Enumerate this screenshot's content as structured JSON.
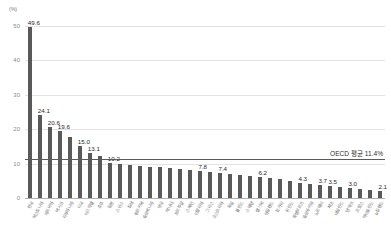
{
  "chart_data": {
    "type": "bar",
    "title": "",
    "xlabel": "",
    "ylabel": "(%)",
    "yunit": "(%)",
    "ylim": [
      0,
      50
    ],
    "yticks": [
      50,
      40,
      30,
      20,
      10,
      0
    ],
    "grid": true,
    "legend": "none",
    "annotations": [
      {
        "text": "OECD 평균 11.4%",
        "value": 11.4,
        "type": "average-line"
      }
    ],
    "categories": [
      "한국",
      "에스토니아",
      "라트비아",
      "멕시코",
      "리투아니아",
      "미국",
      "이스라엘",
      "호주",
      "일본",
      "스위스",
      "칠레",
      "튀르키예",
      "슬로베니아",
      "영국",
      "캐나다",
      "포르투갈",
      "스페인",
      "이탈리아",
      "그리스",
      "오스트리아",
      "독일",
      "폴란드",
      "스웨덴",
      "벨기에",
      "아일랜드",
      "헝가리",
      "핀란드",
      "룩셈부르크",
      "슬로바키아",
      "노르웨이",
      "체코",
      "네덜란드",
      "덴마크",
      "프랑스",
      "아이슬란드",
      "뉴질랜드"
    ],
    "values": [
      49.6,
      24.1,
      20.6,
      19.6,
      17.8,
      15.0,
      13.1,
      12.2,
      10.2,
      9.8,
      9.6,
      9.4,
      9.1,
      8.9,
      8.7,
      8.4,
      8.2,
      7.8,
      7.6,
      7.4,
      7.1,
      6.8,
      6.5,
      6.2,
      5.8,
      5.4,
      5.0,
      4.3,
      4.0,
      3.7,
      3.5,
      3.3,
      3.0,
      2.6,
      2.3,
      2.1
    ],
    "value_labels": {
      "0": "49.6",
      "1": "24.1",
      "2": "20.6",
      "3": "19.6",
      "5": "15.0",
      "6": "13.1",
      "8": "10.2",
      "17": "7.8",
      "19": "7.4",
      "23": "6.2",
      "27": "4.3",
      "29": "3.7",
      "30": "3.5",
      "32": "3.0",
      "35": "2.1"
    },
    "colors": {
      "bar": "#595959",
      "grid": "#e3e3e3",
      "axis": "#b0b0b0",
      "average_line": "#5a5a5a",
      "value_text": "#1f1f1f",
      "tick_text": "#8a8a8a"
    }
  }
}
